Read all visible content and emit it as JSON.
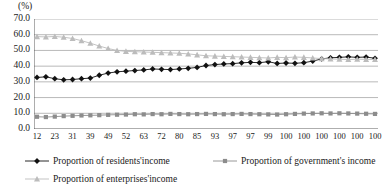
{
  "chart_data": {
    "type": "line",
    "title": "",
    "subtitle": "",
    "xlabel": "",
    "ylabel": "",
    "unit_label": "(%)",
    "ylim": [
      0.0,
      70.0
    ],
    "y_ticks": [
      "0.0",
      "10.0",
      "20.0",
      "30.0",
      "40.0",
      "50.0",
      "60.0",
      "70.0"
    ],
    "y_tick_values": [
      0.0,
      10.0,
      20.0,
      30.0,
      40.0,
      50.0,
      60.0,
      70.0
    ],
    "grid": true,
    "grid_axis": "y",
    "legend_position": "bottom",
    "x_tick_labels": [
      "12",
      "",
      "23",
      "",
      "31",
      "",
      "39",
      "",
      "49",
      "",
      "52",
      "",
      "63",
      "",
      "72",
      "",
      "80",
      "",
      "85",
      "",
      "93",
      "",
      "97",
      "",
      "97",
      "",
      "99",
      "",
      "100",
      "",
      "100",
      "",
      "100",
      "",
      "100",
      "",
      "100",
      "",
      "100"
    ],
    "x_labeled_ticks": [
      "12",
      "23",
      "31",
      "39",
      "49",
      "52",
      "63",
      "72",
      "80",
      "85",
      "93",
      "97",
      "97",
      "99",
      "100",
      "100",
      "100",
      "100",
      "100",
      "100"
    ],
    "n_points": 39,
    "series": [
      {
        "name": "Proportion of residents'income",
        "marker": "diamond",
        "color": "#111111",
        "values": [
          32.8,
          33.2,
          32.0,
          31.3,
          31.5,
          32.0,
          32.4,
          34.2,
          35.6,
          36.4,
          36.8,
          37.2,
          37.6,
          38.2,
          38.0,
          37.8,
          38.2,
          38.6,
          39.2,
          40.4,
          41.0,
          41.4,
          41.6,
          42.1,
          42.4,
          42.2,
          42.8,
          41.7,
          42.0,
          41.8,
          42.2,
          43.2,
          44.6,
          45.3,
          45.6,
          45.9,
          45.6,
          45.8,
          45.0
        ]
      },
      {
        "name": "Proportion of government's income",
        "marker": "square",
        "color": "#8c8c8c",
        "values": [
          7.8,
          7.6,
          7.9,
          8.2,
          8.4,
          8.6,
          8.7,
          8.8,
          9.0,
          9.1,
          9.2,
          9.4,
          9.3,
          9.5,
          9.4,
          9.6,
          9.5,
          9.4,
          9.5,
          9.6,
          9.5,
          9.4,
          9.5,
          9.6,
          9.5,
          9.4,
          9.3,
          9.2,
          9.4,
          9.6,
          9.8,
          9.9,
          10.0,
          9.9,
          10.0,
          9.9,
          9.8,
          9.7,
          9.6
        ]
      },
      {
        "name": "Proportion of enterprises'income",
        "marker": "triangle",
        "color": "#bcbcbc",
        "values": [
          58.8,
          58.6,
          58.9,
          58.4,
          57.6,
          56.2,
          54.6,
          52.8,
          51.2,
          50.0,
          49.4,
          49.2,
          49.0,
          48.8,
          48.6,
          48.4,
          48.2,
          47.8,
          47.2,
          46.6,
          46.4,
          46.2,
          46.0,
          45.8,
          45.6,
          45.4,
          45.2,
          45.6,
          45.4,
          45.8,
          45.6,
          45.2,
          44.8,
          44.6,
          44.4,
          44.2,
          44.4,
          44.3,
          44.2
        ]
      }
    ]
  },
  "legend": {
    "entries": [
      {
        "label": "Proportion of residents'income"
      },
      {
        "label": "Proportion of government's income"
      },
      {
        "label": "Proportion of enterprises'income"
      }
    ]
  }
}
